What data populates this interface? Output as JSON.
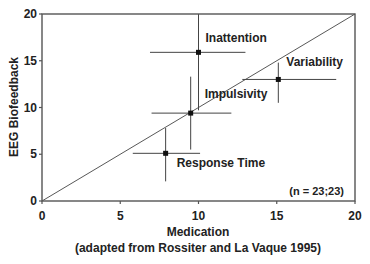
{
  "chart_data": {
    "type": "scatter",
    "title": "",
    "xlabel": "Medication",
    "xlabel_sub": "(adapted from Rossiter and La Vaque 1995)",
    "ylabel": "EEG Biofeedback",
    "xlim": [
      0,
      20
    ],
    "ylim": [
      0,
      20
    ],
    "xticks": [
      0,
      5,
      10,
      15,
      20
    ],
    "yticks": [
      0,
      5,
      10,
      15,
      20
    ],
    "grid": false,
    "reference_line": {
      "from": [
        0,
        0
      ],
      "to": [
        20,
        20
      ],
      "label": "y = x"
    },
    "annotation": "(n = 23;23)",
    "points": [
      {
        "name": "Inattention",
        "x": 10.0,
        "y": 15.9,
        "x_err": [
          6.9,
          13.0
        ],
        "y_err": [
          9.7,
          20.0
        ]
      },
      {
        "name": "Variability",
        "x": 15.1,
        "y": 13.0,
        "x_err": [
          12.8,
          18.8
        ],
        "y_err": [
          10.5,
          14.8
        ]
      },
      {
        "name": "Impulsivity",
        "x": 9.5,
        "y": 9.4,
        "x_err": [
          7.0,
          12.1
        ],
        "y_err": [
          5.5,
          13.3
        ]
      },
      {
        "name": "Response Time",
        "x": 7.9,
        "y": 5.1,
        "x_err": [
          5.8,
          10.1
        ],
        "y_err": [
          2.1,
          7.8
        ]
      }
    ]
  },
  "colors": {
    "line": "#444444",
    "marker": "#111111",
    "text": "#222222"
  }
}
